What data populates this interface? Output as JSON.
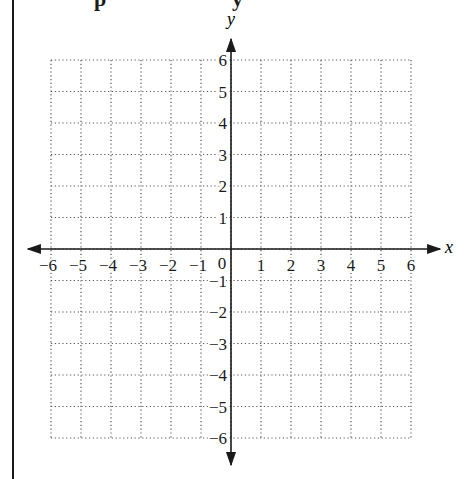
{
  "header": {
    "cut_text_left": "p",
    "cut_text_right": "y"
  },
  "chart_data": {
    "type": "scatter",
    "title": "",
    "xlabel": "x",
    "ylabel": "y",
    "xlim": [
      -6,
      6
    ],
    "ylim": [
      -6,
      6
    ],
    "grid": true,
    "grid_style": "dotted",
    "x_ticks": [
      -6,
      -5,
      -4,
      -3,
      -2,
      -1,
      0,
      1,
      2,
      3,
      4,
      5,
      6
    ],
    "x_tick_labels": [
      "−6",
      "−5",
      "−4",
      "−3",
      "−2",
      "−1",
      "0",
      "1",
      "2",
      "3",
      "4",
      "5",
      "6"
    ],
    "y_ticks": [
      -6,
      -5,
      -4,
      -3,
      -2,
      -1,
      1,
      2,
      3,
      4,
      5,
      6
    ],
    "y_tick_labels": [
      "−6",
      "−5",
      "−4",
      "−3",
      "−2",
      "−1",
      "1",
      "2",
      "3",
      "4",
      "5",
      "6"
    ],
    "series": [],
    "legend": null
  },
  "colors": {
    "axis": "#1a1a1a",
    "grid": "#555555",
    "border": "#1a1a1a"
  }
}
